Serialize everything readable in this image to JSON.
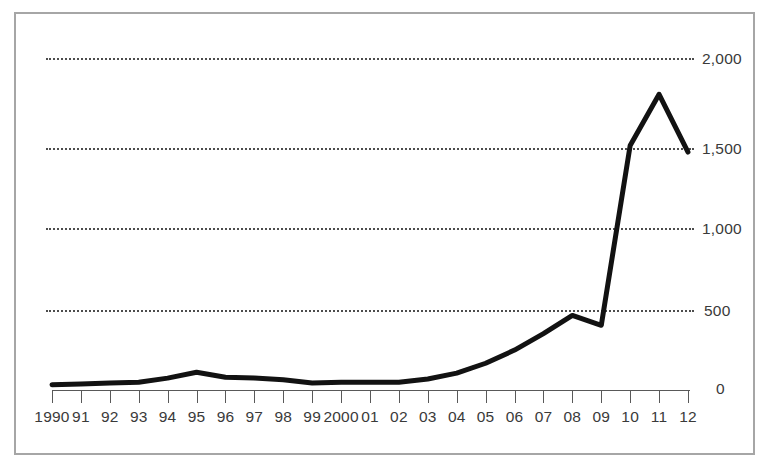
{
  "chart_data": {
    "type": "line",
    "title": "",
    "subtitle": "",
    "xlabel": "",
    "ylabel": "",
    "grid": true,
    "legend": null,
    "legend_position": "none",
    "xlim": [
      1990,
      2012
    ],
    "ylim": [
      0,
      2000
    ],
    "y_ticks": [
      0,
      500,
      1000,
      1500,
      2000
    ],
    "y_ticklabels": [
      "0",
      "500",
      "1,000",
      "1,500",
      "2,000"
    ],
    "y_axis_side": "right",
    "categories": [
      "1990",
      "91",
      "92",
      "93",
      "94",
      "95",
      "96",
      "97",
      "98",
      "99",
      "2000",
      "01",
      "02",
      "03",
      "04",
      "05",
      "06",
      "07",
      "08",
      "09",
      "10",
      "11",
      "12"
    ],
    "x": [
      1990,
      1991,
      1992,
      1993,
      1994,
      1995,
      1996,
      1997,
      1998,
      1999,
      2000,
      2001,
      2002,
      2003,
      2004,
      2005,
      2006,
      2007,
      2008,
      2009,
      2010,
      2011,
      2012
    ],
    "values": [
      20,
      25,
      30,
      35,
      60,
      95,
      65,
      60,
      50,
      30,
      35,
      35,
      35,
      55,
      90,
      150,
      230,
      330,
      440,
      380,
      1470,
      1780,
      1430
    ],
    "series": [
      {
        "name": "series-1",
        "color": "#121212",
        "values": [
          20,
          25,
          30,
          35,
          60,
          95,
          65,
          60,
          50,
          30,
          35,
          35,
          35,
          55,
          90,
          150,
          230,
          330,
          440,
          380,
          1470,
          1780,
          1430
        ]
      }
    ],
    "annotations": []
  },
  "axis": {
    "y_labels": {
      "v0": "0",
      "v500": "500",
      "v1000": "1,000",
      "v1500": "1,500",
      "v2000": "2,000"
    }
  },
  "colors": {
    "line": "#121212",
    "grid": "#4d4d4d",
    "axis": "#595959",
    "frame": "#a6a6a6",
    "text": "#3a3a3a",
    "background": "#ffffff"
  }
}
